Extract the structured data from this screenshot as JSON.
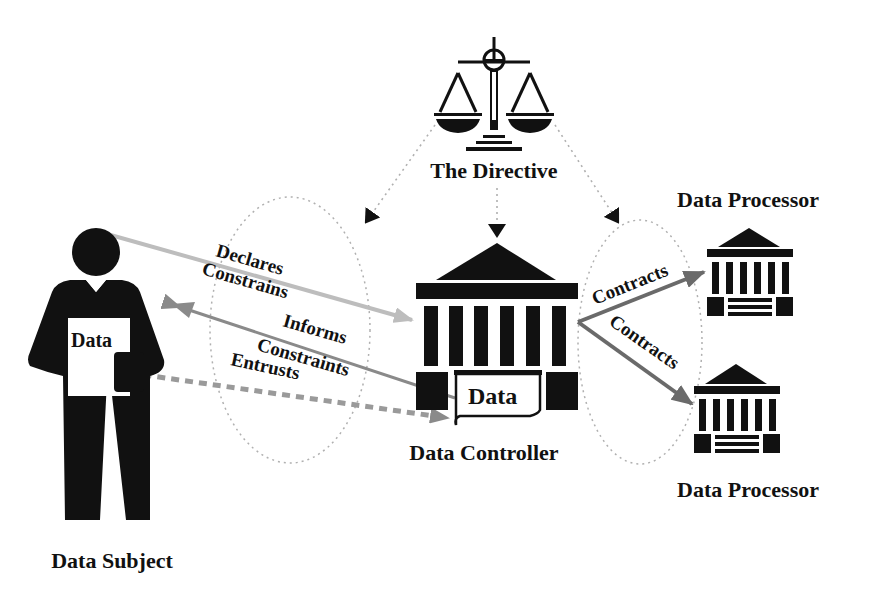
{
  "diagram": {
    "nodes": {
      "directive": {
        "label": "The Directive",
        "icon": "scales-of-justice-icon"
      },
      "subject": {
        "label": "Data Subject",
        "icon": "person-icon",
        "document_label": "Data"
      },
      "controller": {
        "label": "Data Controller",
        "icon": "institution-building-icon",
        "document_label": "Data"
      },
      "processor_top": {
        "label": "Data Processor",
        "icon": "institution-building-icon"
      },
      "processor_bottom": {
        "label": "Data Processor",
        "icon": "institution-building-icon"
      }
    },
    "edges": {
      "subject_to_controller": {
        "labels": [
          "Declares",
          "Constrains"
        ],
        "style": "solid-light-gray",
        "from": "Data Subject",
        "to": "Data Controller"
      },
      "controller_to_subject": {
        "labels": [
          "Informs",
          "Constraints"
        ],
        "style": "solid-gray",
        "from": "Data Controller",
        "to": "Data Subject"
      },
      "entrusts": {
        "label": "Entrusts",
        "style": "dashed-gray",
        "from": "Data Subject",
        "to": "Data Controller"
      },
      "contracts_top": {
        "label": "Contracts",
        "style": "solid-dark-gray",
        "from": "Data Controller",
        "to": "Data Processor"
      },
      "contracts_bottom": {
        "label": "Contracts",
        "style": "solid-dark-gray",
        "from": "Data Controller",
        "to": "Data Processor"
      },
      "directive_arrows": {
        "style": "dotted",
        "targets": [
          "Data Subject relation",
          "Data Controller",
          "Data Processor relation"
        ]
      }
    },
    "colors": {
      "ink": "#111111",
      "arrow_light": "#b8b8b8",
      "arrow_mid": "#8a8a8a",
      "arrow_dark": "#6a6a6a",
      "dotted": "#b0b0b0"
    }
  }
}
